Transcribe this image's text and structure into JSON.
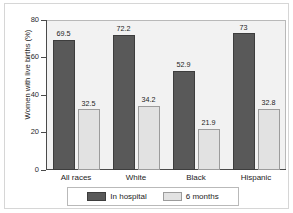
{
  "chart_data": {
    "type": "bar",
    "title": "",
    "subtitle": "",
    "xlabel": "",
    "ylabel": "Women with live births (%)",
    "ylim": [
      0,
      80
    ],
    "yticks": [
      0,
      20,
      40,
      60,
      80
    ],
    "ytick_labels": [
      "0",
      "20",
      "40",
      "60",
      "80"
    ],
    "grid": false,
    "legend_position": "bottom",
    "categories": [
      "All races",
      "White",
      "Black",
      "Hispanic"
    ],
    "series": [
      {
        "name": "In hospital",
        "color": "#595959",
        "values": [
          69.5,
          72.2,
          52.9,
          73
        ],
        "value_labels": [
          "69.5",
          "72.2",
          "52.9",
          "73"
        ]
      },
      {
        "name": "6 months",
        "color": "#e2e2e2",
        "values": [
          32.5,
          34.2,
          21.9,
          32.8
        ],
        "value_labels": [
          "32.5",
          "34.2",
          "21.9",
          "32.8"
        ]
      }
    ]
  },
  "legend": {
    "items": [
      {
        "label": "In hospital",
        "color": "#595959"
      },
      {
        "label": "6 months",
        "color": "#e2e2e2"
      }
    ]
  },
  "colors": {
    "in_hospital": "#595959",
    "six_months": "#e2e2e2",
    "panel_background": "#f2f2f2",
    "axis": "#4a4a4a",
    "frame": "#d6d6d6"
  }
}
